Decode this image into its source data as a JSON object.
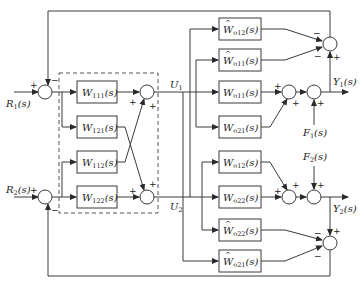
{
  "diagram": {
    "type": "block-diagram",
    "title": "",
    "inputs": [
      {
        "id": "R1",
        "label": "R",
        "sub": "1",
        "arg": "(s)"
      },
      {
        "id": "R2",
        "label": "R",
        "sub": "2",
        "arg": "(s)"
      }
    ],
    "intermediate": [
      {
        "id": "U1",
        "label": "U",
        "sub": "1"
      },
      {
        "id": "U2",
        "label": "U",
        "sub": "2"
      }
    ],
    "outputs": [
      {
        "id": "Y1",
        "label": "Y",
        "sub": "1",
        "arg": "(s)"
      },
      {
        "id": "Y2",
        "label": "Y",
        "sub": "2",
        "arg": "(s)"
      }
    ],
    "disturbances": [
      {
        "id": "F1",
        "label": "F",
        "sub": "1",
        "arg": "(s)"
      },
      {
        "id": "F2",
        "label": "F",
        "sub": "2",
        "arg": "(s)"
      }
    ],
    "controller_blocks": [
      {
        "id": "W111",
        "label": "W",
        "sub": "111",
        "arg": "(s)",
        "hat": false
      },
      {
        "id": "W121",
        "label": "W",
        "sub": "121",
        "arg": "(s)",
        "hat": false
      },
      {
        "id": "W112",
        "label": "W",
        "sub": "112",
        "arg": "(s)",
        "hat": false
      },
      {
        "id": "W122",
        "label": "W",
        "sub": "122",
        "arg": "(s)",
        "hat": false
      }
    ],
    "plant_blocks": [
      {
        "id": "Wo12hat",
        "label": "W",
        "sub": "o12",
        "arg": "(s)",
        "hat": true
      },
      {
        "id": "Wo11hat",
        "label": "W",
        "sub": "o11",
        "arg": "(s)",
        "hat": true
      },
      {
        "id": "Wo11",
        "label": "W",
        "sub": "o11",
        "arg": "(s)",
        "hat": false
      },
      {
        "id": "Wo21",
        "label": "W",
        "sub": "o21",
        "arg": "(s)",
        "hat": false
      },
      {
        "id": "Wo12",
        "label": "W",
        "sub": "o12",
        "arg": "(s)",
        "hat": false
      },
      {
        "id": "Wo22",
        "label": "W",
        "sub": "o22",
        "arg": "(s)",
        "hat": false
      },
      {
        "id": "Wo22hat",
        "label": "W",
        "sub": "o22",
        "arg": "(s)",
        "hat": true
      },
      {
        "id": "Wo21hat",
        "label": "W",
        "sub": "o21",
        "arg": "(s)",
        "hat": true
      }
    ],
    "signs": {
      "plus": "+",
      "minus": "−"
    }
  }
}
